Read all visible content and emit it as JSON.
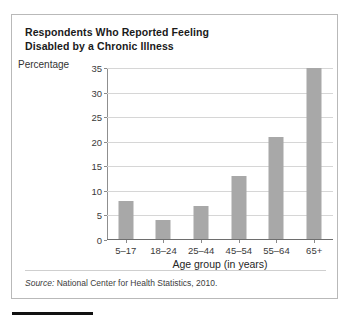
{
  "figure": {
    "title_line1": "Respondents Who Reported Feeling",
    "title_line2": "Disabled by a Chronic Illness",
    "source_prefix": "Source:",
    "source_text": "National Center for Health Statistics, 2010."
  },
  "colors": {
    "bar_fill": "#a8a8a8",
    "gridline": "#d6d6d6",
    "axis": "#6e6e6e",
    "frame_border": "#b9b9b9",
    "text": "#1a1a1a"
  },
  "chart_data": {
    "type": "bar",
    "title": "Respondents Who Reported Feeling Disabled by a Chronic Illness",
    "subtitle": "",
    "xlabel": "Age group (in years)",
    "ylabel": "Percentage",
    "categories": [
      "5–17",
      "18–24",
      "25–44",
      "45–54",
      "55–64",
      "65+"
    ],
    "values": [
      8,
      4,
      7,
      13,
      21,
      35
    ],
    "ylim": [
      0,
      35
    ],
    "yticks": [
      0,
      5,
      10,
      15,
      20,
      25,
      30,
      35
    ],
    "ytick_labels": [
      "0",
      "5",
      "10",
      "15",
      "20",
      "25",
      "30",
      "35"
    ],
    "grid": true,
    "legend": false,
    "legend_position": "none",
    "annotations": [
      "Source: National Center for Health Statistics, 2010."
    ]
  }
}
